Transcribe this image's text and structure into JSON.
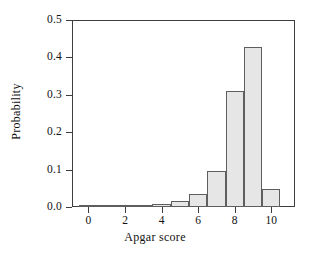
{
  "chart_data": {
    "type": "bar",
    "title": "",
    "subtitle": "",
    "xlabel": "Apgar score",
    "ylabel": "Probability",
    "categories": [
      0,
      1,
      2,
      3,
      4,
      5,
      6,
      7,
      8,
      9,
      10
    ],
    "values": [
      0.004,
      0.002,
      0.004,
      0.004,
      0.008,
      0.016,
      0.035,
      0.095,
      0.311,
      0.428,
      0.049
    ],
    "bar_width": 1,
    "xlim": [
      -0.9,
      11.3
    ],
    "ylim": [
      0.0,
      0.5
    ],
    "xticks": [
      0,
      2,
      4,
      6,
      8,
      10
    ],
    "xtick_labels": [
      "0",
      "2",
      "4",
      "6",
      "8",
      "10"
    ],
    "yticks": [
      0.0,
      0.1,
      0.2,
      0.3,
      0.4,
      0.5
    ],
    "ytick_labels": [
      "0.0",
      "0.1",
      "0.2",
      "0.3",
      "0.4",
      "0.5"
    ],
    "grid": false,
    "legend": false,
    "legend_position": "none",
    "colors": {
      "bar_fill": "#e6e6e6",
      "bar_edge": "#5e5e5e",
      "axis": "#3d3d3d",
      "text": "#111111",
      "background": "#ffffff"
    }
  }
}
